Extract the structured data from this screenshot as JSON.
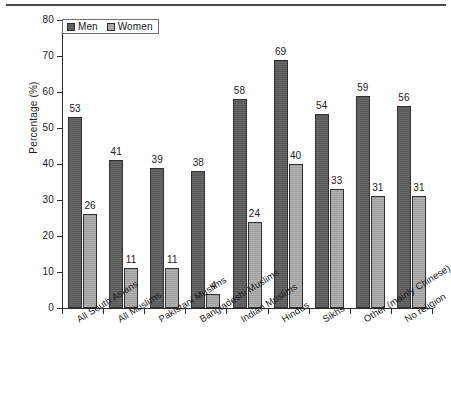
{
  "chart_data": {
    "type": "bar",
    "title": "",
    "subtitle": "",
    "xlabel": "",
    "ylabel": "Percentage (%)",
    "ylim": [
      0,
      80
    ],
    "ytick_step": 10,
    "yticks": [
      0,
      10,
      20,
      30,
      40,
      50,
      60,
      70,
      80
    ],
    "grid": false,
    "legend_position": "top-left",
    "data_labels": true,
    "categories": [
      "All South Asians",
      "All Muslims",
      "Pakistani Muslims",
      "Bangladeshi Muslims",
      "Indian Muslims",
      "Hindus",
      "Sikhs",
      "Other (mainly Chinese)",
      "No religion"
    ],
    "series": [
      {
        "name": "Men",
        "color": "#5e5e5e",
        "values": [
          53,
          41,
          39,
          38,
          58,
          69,
          54,
          59,
          56
        ]
      },
      {
        "name": "Women",
        "color": "#a8a8a8",
        "values": [
          26,
          11,
          11,
          4,
          24,
          40,
          33,
          31,
          31
        ]
      }
    ]
  },
  "legend": {
    "entries": [
      {
        "label": "Men",
        "swatch": "men"
      },
      {
        "label": "Women",
        "swatch": "women"
      }
    ]
  },
  "axes": {
    "y_title": "Percentage (%)",
    "y_tick_labels": [
      "80",
      "70",
      "60",
      "50",
      "40",
      "30",
      "20",
      "10",
      "0"
    ]
  }
}
